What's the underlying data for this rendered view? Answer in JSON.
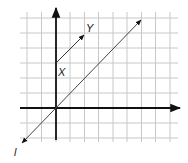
{
  "diagram": {
    "type": "coordinate-grid",
    "grid": {
      "x_lines": [
        27,
        41.5,
        56,
        70,
        84.5,
        98.5,
        113,
        127,
        141.5,
        155.5,
        170
      ],
      "y_lines": [
        18,
        33,
        48,
        63,
        78,
        93,
        108,
        123,
        138
      ],
      "x_min": 20,
      "x_max": 178,
      "y_min": 12,
      "y_max": 142,
      "color": "#c8c8c8"
    },
    "axes": {
      "origin": [
        56,
        108
      ],
      "x_axis": {
        "from": [
          20,
          108
        ],
        "to": [
          180,
          108
        ]
      },
      "y_axis": {
        "from": [
          56,
          140
        ],
        "to": [
          56,
          8
        ]
      },
      "color": "#111111"
    },
    "segment_xy": {
      "from": [
        56,
        63
      ],
      "to": [
        84,
        35
      ],
      "color": "#333333"
    },
    "line_l": {
      "from": [
        22,
        143
      ],
      "to": [
        141,
        20
      ],
      "color": "#444444"
    },
    "labels": {
      "x_label": "X",
      "y_label": "Y",
      "line_label": "l"
    }
  }
}
